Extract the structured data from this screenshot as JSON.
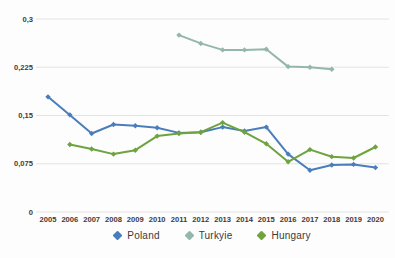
{
  "chart_data": {
    "type": "line",
    "title": "",
    "xlabel": "",
    "ylabel": "",
    "x": [
      "2005",
      "2006",
      "2007",
      "2008",
      "2009",
      "2010",
      "2011",
      "2012",
      "2013",
      "2014",
      "2015",
      "2016",
      "2017",
      "2018",
      "2019",
      "2020"
    ],
    "ylim": [
      0,
      0.3
    ],
    "y_ticks": [
      {
        "value": 0,
        "label": "0"
      },
      {
        "value": 0.075,
        "label": "0,075"
      },
      {
        "value": 0.15,
        "label": "0,15"
      },
      {
        "value": 0.225,
        "label": "0,225"
      },
      {
        "value": 0.3,
        "label": "0,3"
      }
    ],
    "grid": "horizontal",
    "legend_position": "bottom",
    "marker_shape": "diamond",
    "series": [
      {
        "name": "Poland",
        "color": "#4a7eba",
        "values": [
          0.179,
          0.151,
          0.122,
          0.136,
          0.134,
          0.131,
          0.123,
          0.124,
          0.132,
          0.126,
          0.132,
          0.09,
          0.065,
          0.073,
          0.074,
          0.069
        ]
      },
      {
        "name": "Turkyie",
        "color": "#94b6ad",
        "values": [
          null,
          null,
          null,
          null,
          null,
          null,
          0.275,
          0.262,
          0.252,
          0.252,
          0.253,
          0.226,
          0.225,
          0.222,
          null,
          null
        ]
      },
      {
        "name": "Hungary",
        "color": "#6ea33d",
        "values": [
          null,
          0.105,
          0.098,
          0.09,
          0.096,
          0.118,
          0.122,
          0.124,
          0.139,
          0.124,
          0.106,
          0.078,
          0.097,
          0.086,
          0.084,
          0.101
        ]
      }
    ],
    "colors": {
      "gridline": "#e3e3e3",
      "tick_text": "#3c3c3c",
      "background": "#fdfdfd"
    }
  }
}
